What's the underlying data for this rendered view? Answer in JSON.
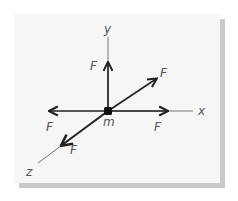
{
  "diagram": {
    "mass_label": "m",
    "axes": {
      "x_label": "x",
      "y_label": "y",
      "z_label": "z"
    },
    "forces": [
      {
        "direction": "+y",
        "label": "F"
      },
      {
        "direction": "-x",
        "label": "F"
      },
      {
        "direction": "+x",
        "label": "F"
      },
      {
        "direction": "-z",
        "label": "F"
      },
      {
        "direction": "+z",
        "label": "F"
      }
    ],
    "colors": {
      "line": "#222222",
      "axis": "#777777",
      "label": "#555555",
      "panel": "#f6f6f6",
      "shadow": "#c9c9c9"
    }
  }
}
